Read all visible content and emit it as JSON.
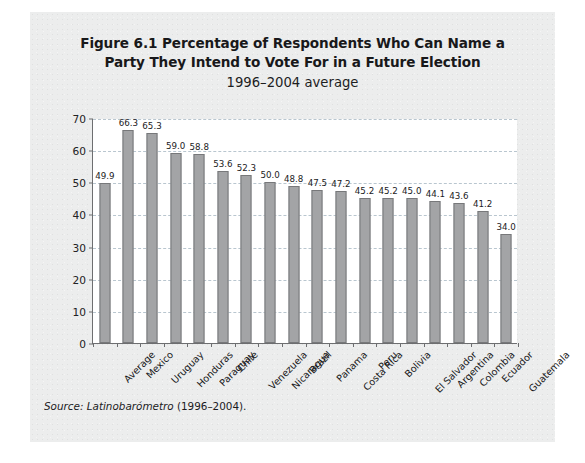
{
  "figure": {
    "title_lines": [
      "Figure 6.1 Percentage of Respondents Who Can Name a",
      "Party They Intend to Vote For in a Future Election"
    ],
    "subtitle": "1996–2004 average",
    "source_label": "Source:",
    "source_name": "Latinobarómetro",
    "source_period": "(1996–2004)."
  },
  "style": {
    "page_bg": "#eceded",
    "plot_bg": "#ffffff",
    "bar_fill": "#a3a4a6",
    "bar_stroke": "#77787a",
    "axis_color": "#6d6e70",
    "grid_color": "#b9c6cf",
    "text_color": "#18181a"
  },
  "chart_data": {
    "type": "bar",
    "title": "Figure 6.1 Percentage of Respondents Who Can Name a Party They Intend to Vote For in a Future Election",
    "subtitle": "1996–2004 average",
    "xlabel": "",
    "ylabel": "",
    "ylim": [
      0,
      70
    ],
    "yticks": [
      0,
      10,
      20,
      30,
      40,
      50,
      60,
      70
    ],
    "grid": true,
    "grid_style": "dashed-horizontal",
    "legend": null,
    "categories": [
      "Average",
      "Mexico",
      "Uruguay",
      "Honduras",
      "Paraguay",
      "Chile",
      "Venezuela",
      "Nicaragua",
      "Brazil",
      "Panama",
      "Costa Rica",
      "Peru",
      "Bolivia",
      "El Salvador",
      "Argentina",
      "Colombia",
      "Ecuador",
      "Guatemala"
    ],
    "values": [
      49.9,
      66.3,
      65.3,
      59.0,
      58.8,
      53.6,
      52.3,
      50.0,
      48.8,
      47.5,
      47.2,
      45.2,
      45.2,
      45.0,
      44.1,
      43.6,
      41.2,
      34.0
    ],
    "value_labels": [
      "49.9",
      "66.3",
      "65.3",
      "59.0",
      "58.8",
      "53.6",
      "52.3",
      "50.0",
      "48.8",
      "47.5",
      "47.2",
      "45.2",
      "45.2",
      "45.0",
      "44.1",
      "43.6",
      "41.2",
      "34.0"
    ]
  }
}
